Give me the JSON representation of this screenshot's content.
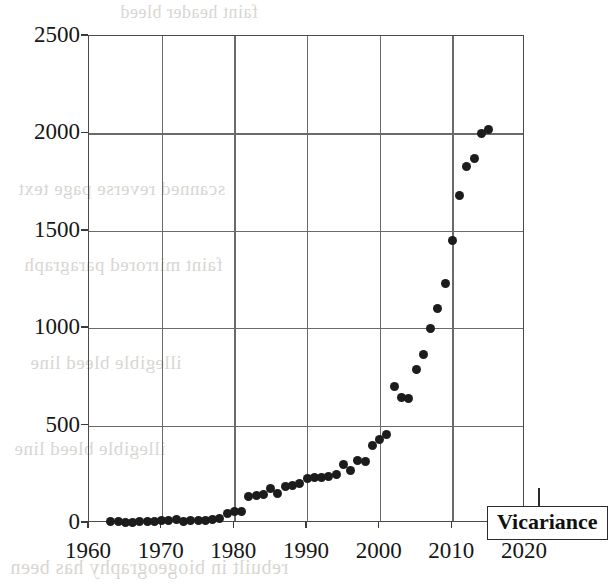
{
  "figure": {
    "background_color": "#ffffff",
    "axis_color": "#4a4a4a",
    "grid_color": "#6a6a6a",
    "marker_color": "#1c1c1c"
  },
  "legend": {
    "label": "Vicariance",
    "position": "inside-bottom-right"
  },
  "bleed_through": {
    "line_a": "scanned reverse page text",
    "line_b": "faint mirrored paragraph",
    "line_c": "illegible bleed line",
    "line_d": "illegible bleed line",
    "line_e": "rebuilt in biogeography has been",
    "line_f": "faint header bleed"
  },
  "chart_data": {
    "type": "scatter",
    "title": "",
    "xlabel": "",
    "ylabel": "",
    "xlim": [
      1960,
      2020
    ],
    "ylim": [
      0,
      2500
    ],
    "xticks": [
      1960,
      1970,
      1980,
      1990,
      2000,
      2010,
      2020
    ],
    "yticks": [
      0,
      500,
      1000,
      1500,
      2000,
      2500
    ],
    "grid": true,
    "legend_position": "bottom-right",
    "series": [
      {
        "name": "Vicariance",
        "marker": "filled-circle",
        "color": "#1c1c1c",
        "points": [
          [
            1963,
            6
          ],
          [
            1964,
            8
          ],
          [
            1965,
            4
          ],
          [
            1966,
            3
          ],
          [
            1967,
            7
          ],
          [
            1968,
            9
          ],
          [
            1969,
            10
          ],
          [
            1970,
            12
          ],
          [
            1971,
            14
          ],
          [
            1972,
            18
          ],
          [
            1973,
            10
          ],
          [
            1974,
            11
          ],
          [
            1975,
            13
          ],
          [
            1976,
            15
          ],
          [
            1977,
            18
          ],
          [
            1978,
            22
          ],
          [
            1979,
            48
          ],
          [
            1980,
            60
          ],
          [
            1981,
            58
          ],
          [
            1982,
            135
          ],
          [
            1983,
            140
          ],
          [
            1984,
            148
          ],
          [
            1985,
            175
          ],
          [
            1986,
            150
          ],
          [
            1987,
            185
          ],
          [
            1988,
            190
          ],
          [
            1989,
            205
          ],
          [
            1990,
            230
          ],
          [
            1991,
            235
          ],
          [
            1992,
            232
          ],
          [
            1993,
            240
          ],
          [
            1994,
            250
          ],
          [
            1995,
            300
          ],
          [
            1996,
            270
          ],
          [
            1997,
            320
          ],
          [
            1998,
            318
          ],
          [
            1999,
            400
          ],
          [
            2000,
            430
          ],
          [
            2001,
            455
          ],
          [
            2002,
            700
          ],
          [
            2003,
            645
          ],
          [
            2004,
            640
          ],
          [
            2005,
            790
          ],
          [
            2006,
            865
          ],
          [
            2007,
            1000
          ],
          [
            2008,
            1100
          ],
          [
            2009,
            1230
          ],
          [
            2010,
            1450
          ],
          [
            2011,
            1680
          ],
          [
            2012,
            1830
          ],
          [
            2013,
            1870
          ],
          [
            2014,
            2000
          ],
          [
            2015,
            2020
          ]
        ]
      }
    ]
  }
}
